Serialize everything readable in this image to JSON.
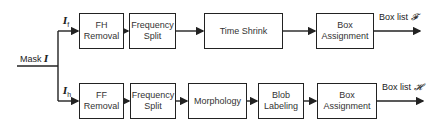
{
  "input": {
    "label": "Mask",
    "symbol": "I"
  },
  "branches": [
    {
      "id": "top",
      "signal": {
        "symbol": "I",
        "sub": "f"
      },
      "blocks": [
        "FH\nRemoval",
        "Frequency\nSplit",
        "Time Shrink",
        "Box\nAssignment"
      ],
      "output": {
        "label": "Box list",
        "symbol": "𝓕"
      }
    },
    {
      "id": "bottom",
      "signal": {
        "symbol": "I",
        "sub": "h"
      },
      "blocks": [
        "FF\nRemoval",
        "Frequency\nSplit",
        "Morphology",
        "Blob\nLabeling",
        "Box\nAssignment"
      ],
      "output": {
        "label": "Box list",
        "symbol": "𝓗"
      }
    }
  ],
  "colors": {
    "line": "#222222",
    "text": "#333333"
  }
}
